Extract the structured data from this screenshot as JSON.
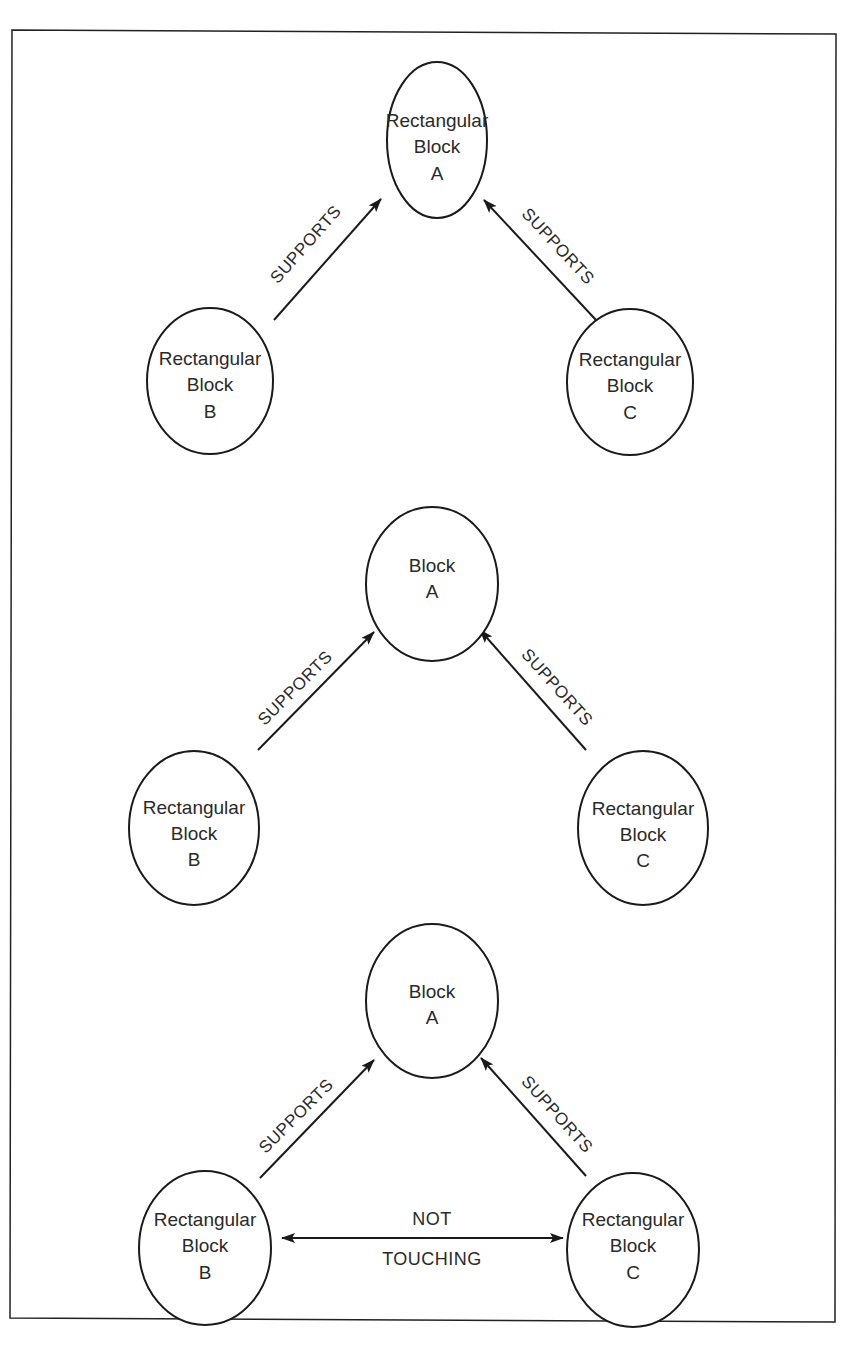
{
  "colors": {
    "stroke": "#1a1a1a",
    "text": "#2a2a2a",
    "background": "#ffffff"
  },
  "diagrams": [
    {
      "nodes": {
        "A": {
          "lines": [
            "Rectangular",
            "Block",
            "A"
          ]
        },
        "B": {
          "lines": [
            "Rectangular",
            "Block",
            "B"
          ]
        },
        "C": {
          "lines": [
            "Rectangular",
            "Block",
            "C"
          ]
        }
      },
      "edges": [
        {
          "from": "B",
          "to": "A",
          "label": "SUPPORTS",
          "arrow": "to"
        },
        {
          "from": "C",
          "to": "A",
          "label": "SUPPORTS",
          "arrow": "to"
        }
      ]
    },
    {
      "nodes": {
        "A": {
          "lines": [
            "Block",
            "A"
          ]
        },
        "B": {
          "lines": [
            "Rectangular",
            "Block",
            "B"
          ]
        },
        "C": {
          "lines": [
            "Rectangular",
            "Block",
            "C"
          ]
        }
      },
      "edges": [
        {
          "from": "B",
          "to": "A",
          "label": "SUPPORTS",
          "arrow": "to"
        },
        {
          "from": "C",
          "to": "A",
          "label": "SUPPORTS",
          "arrow": "to"
        }
      ]
    },
    {
      "nodes": {
        "A": {
          "lines": [
            "Block",
            "A"
          ]
        },
        "B": {
          "lines": [
            "Rectangular",
            "Block",
            "B"
          ]
        },
        "C": {
          "lines": [
            "Rectangular",
            "Block",
            "C"
          ]
        }
      },
      "edges": [
        {
          "from": "B",
          "to": "A",
          "label": "SUPPORTS",
          "arrow": "to"
        },
        {
          "from": "C",
          "to": "A",
          "label": "SUPPORTS",
          "arrow": "to"
        },
        {
          "from": "B",
          "to": "C",
          "label_top": "NOT",
          "label_bottom": "TOUCHING",
          "arrow": "both"
        }
      ]
    }
  ]
}
